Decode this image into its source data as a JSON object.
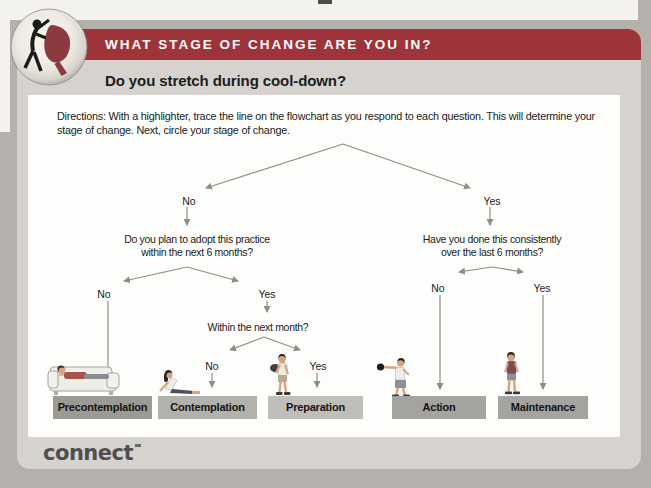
{
  "header": {
    "banner_title": "WHAT STAGE OF CHANGE ARE YOU IN?",
    "subtitle": "Do you stretch during cool-down?",
    "icon": "dancers-icon"
  },
  "directions": "Directions: With a highlighter, trace the line on the flowchart as you respond to each question. This will determine your stage of change. Next, circle your stage of change.",
  "flowchart": {
    "branches": {
      "root": {
        "no": "No",
        "yes": "Yes"
      },
      "adopt": {
        "no": "No",
        "yes": "Yes"
      },
      "month": {
        "no": "No",
        "yes": "Yes"
      },
      "consistent": {
        "no": "No",
        "yes": "Yes"
      }
    },
    "questions": {
      "adopt_line1": "Do you plan to adopt this practice",
      "adopt_line2": "within the next 6 months?",
      "month": "Within the next month?",
      "consistent_line1": "Have you done this consistently",
      "consistent_line2": "over the last 6 months?"
    },
    "stages": [
      {
        "label": "Precontemplation",
        "color": "#9c9a95",
        "figure": "person-on-couch-icon"
      },
      {
        "label": "Contemplation",
        "color": "#b3b1ac",
        "figure": "person-sitting-icon"
      },
      {
        "label": "Preparation",
        "color": "#c0beb9",
        "figure": "person-walking-with-bag-icon"
      },
      {
        "label": "Action",
        "color": "#a5a39f",
        "figure": "person-boxing-icon"
      },
      {
        "label": "Maintenance",
        "color": "#a5a39f",
        "figure": "person-standing-icon"
      }
    ]
  },
  "footer": {
    "logo_text": "connect"
  },
  "colors": {
    "banner": "#9e3339",
    "page_bg": "#b4b1ac",
    "card_bg": "#d6d3ce",
    "sheet_bg": "#fdfdfb",
    "arrow": "#8f8d89"
  }
}
